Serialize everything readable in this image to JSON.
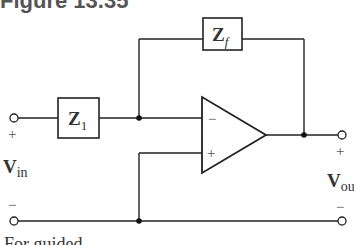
{
  "figure": {
    "title": "Figure 13.35",
    "caption": "For guided"
  },
  "components": {
    "z1": {
      "label": "Z",
      "subscript": "1"
    },
    "zf": {
      "label": "Z",
      "subscript": "f"
    },
    "opamp": {
      "inverting_sign": "−",
      "noninverting_sign": "+"
    }
  },
  "ports": {
    "input": {
      "label": "V",
      "subscript": "in",
      "plus": "+",
      "minus": "−"
    },
    "output": {
      "label": "V",
      "subscript": "ou",
      "plus": "+",
      "minus": "−"
    }
  },
  "colors": {
    "wire": "#222222",
    "text": "#333333",
    "title": "#555555"
  }
}
